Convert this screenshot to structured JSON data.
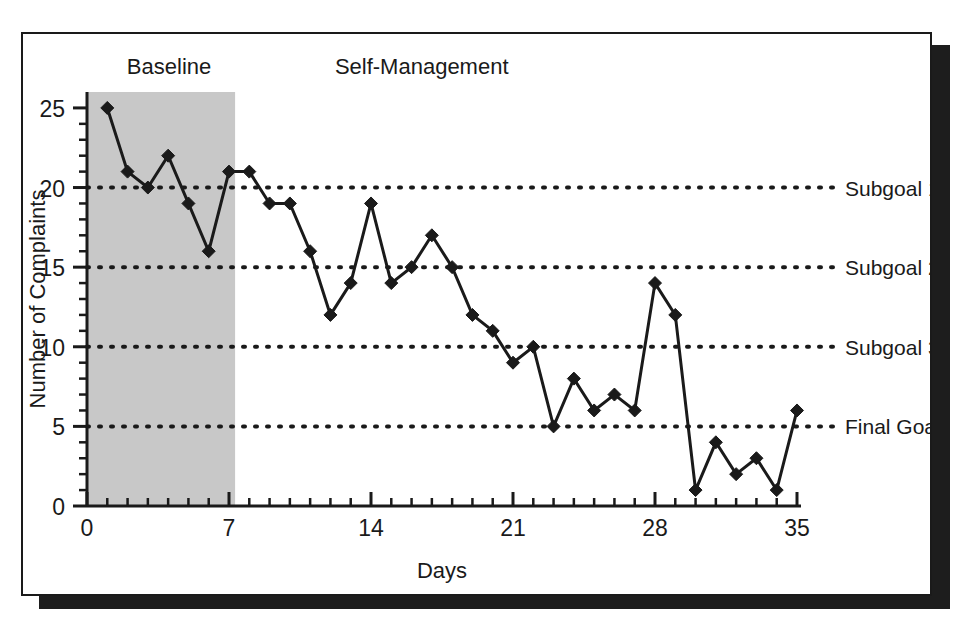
{
  "figure": {
    "frame_border_color": "#1a1a1a",
    "shadow_color": "#1d1d1d",
    "background_color": "#ffffff"
  },
  "chart_data": {
    "type": "line",
    "title": "",
    "xlabel": "Days",
    "ylabel": "Number of Complaints",
    "xlim": [
      0,
      35
    ],
    "ylim": [
      0,
      26
    ],
    "x_ticks": [
      0,
      7,
      14,
      21,
      28,
      35
    ],
    "x_tick_labels": [
      "0",
      "7",
      "14",
      "21",
      "28",
      "35"
    ],
    "x_minor_tick_step": 1,
    "y_ticks": [
      0,
      5,
      10,
      15,
      20,
      25
    ],
    "y_tick_labels": [
      "0",
      "5",
      "10",
      "15",
      "20",
      "25"
    ],
    "y_minor_tick_step": 1,
    "grid": false,
    "legend": "none",
    "marker": "diamond",
    "line_color": "#1a1a1a",
    "marker_color": "#1a1a1a",
    "x": [
      1,
      2,
      3,
      4,
      5,
      6,
      7,
      8,
      9,
      10,
      11,
      12,
      13,
      14,
      15,
      16,
      17,
      18,
      19,
      20,
      21,
      22,
      23,
      24,
      25,
      26,
      27,
      28,
      29,
      30,
      31,
      32,
      33,
      34,
      35
    ],
    "values": [
      25,
      21,
      20,
      22,
      19,
      16,
      21,
      21,
      19,
      19,
      16,
      12,
      14,
      19,
      14,
      15,
      17,
      15,
      12,
      11,
      9,
      10,
      5,
      8,
      6,
      7,
      6,
      14,
      12,
      1,
      4,
      2,
      3,
      1,
      6
    ],
    "phases": [
      {
        "name": "Baseline",
        "label": "Baseline",
        "x_start": 0,
        "x_end": 7.3,
        "shaded": true,
        "shade_color": "#c8c8c8"
      },
      {
        "name": "Self-Management",
        "label": "Self-Management",
        "x_start": 7.3,
        "x_end": 35,
        "shaded": false,
        "shade_color": "#ffffff"
      }
    ],
    "reference_lines": [
      {
        "label": "Subgoal 1",
        "value": 20,
        "style": "dotted"
      },
      {
        "label": "Subgoal 2",
        "value": 15,
        "style": "dotted"
      },
      {
        "label": "Subgoal 3",
        "value": 10,
        "style": "dotted"
      },
      {
        "label": "Final Goal",
        "value": 5,
        "style": "dotted"
      }
    ]
  }
}
